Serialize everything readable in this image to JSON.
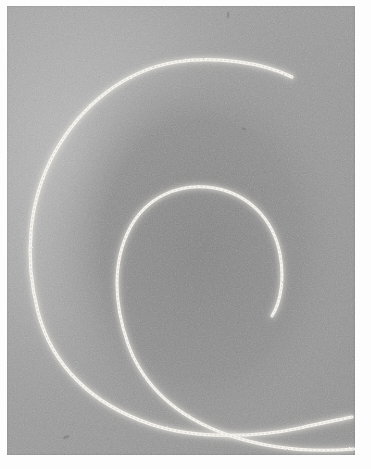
{
  "image": {
    "title": "Spiral particle track photograph",
    "kind": "grayscale-photograph",
    "subject": "bubble-chamber-spiral-track",
    "width_px": 371,
    "height_px": 469,
    "paper_border_color": "#fdfdfd",
    "plate": {
      "left_px": 7,
      "top_px": 6,
      "width_px": 348,
      "height_px": 449
    }
  },
  "palette": {
    "paper_white": "#fdfdfd",
    "background_gray_light": "#b4b4b4",
    "background_gray_mid": "#9b9b9b",
    "background_gray_dark": "#8a8a8a",
    "track_white": "#f7f5ef",
    "track_glow": "#d9d7d0",
    "speck_dark": "#6d6d6d"
  },
  "scene": {
    "description": "Two bright white spiral tracks curving clockwise inward on a mottled gray field",
    "regions": [
      {
        "name": "upper-left-light-field",
        "tone": "#b6b6b6"
      },
      {
        "name": "inner-spiral-dark-field",
        "tone": "#8b8b8b"
      },
      {
        "name": "outer-right-mid-field",
        "tone": "#9a9a9a"
      },
      {
        "name": "lower-left-mid-field",
        "tone": "#a4a4a4"
      }
    ]
  },
  "tracks": [
    {
      "id": "outer-track",
      "label": "Outer spiral arc",
      "stroke_color": "#f7f5ef",
      "stroke_width_px": 3.2,
      "start_point": {
        "x": 292,
        "y": 77
      },
      "end_point": {
        "x": 348,
        "y": 432
      },
      "path": "M 292 77 C 262 62, 214 56, 176 62 C 126 70, 82 104, 55 152 C 28 200, 24 258, 38 312 C 52 366, 92 404, 150 424 C 196 440, 258 437, 300 428 C 322 423, 338 420, 352 417"
    },
    {
      "id": "inner-track",
      "label": "Inner spiral arc",
      "stroke_color": "#f7f5ef",
      "stroke_width_px": 3.0,
      "start_point": {
        "x": 272,
        "y": 316
      },
      "end_point": {
        "x": 348,
        "y": 452
      },
      "path": "M 272 316 C 282 300, 284 276, 280 254 C 273 218, 248 194, 214 188 C 178 182, 146 198, 130 228 C 112 262, 114 304, 128 344 C 144 388, 180 418, 228 435 C 272 450, 318 452, 354 449"
    }
  ],
  "artifacts": [
    {
      "id": "speck-1",
      "x": 66,
      "y": 437,
      "w": 6,
      "h": 3,
      "angle": -22
    },
    {
      "id": "speck-2",
      "x": 228,
      "y": 14,
      "w": 2,
      "h": 7,
      "angle": 4
    },
    {
      "id": "speck-3",
      "x": 244,
      "y": 129,
      "w": 5,
      "h": 3,
      "angle": 18
    }
  ]
}
